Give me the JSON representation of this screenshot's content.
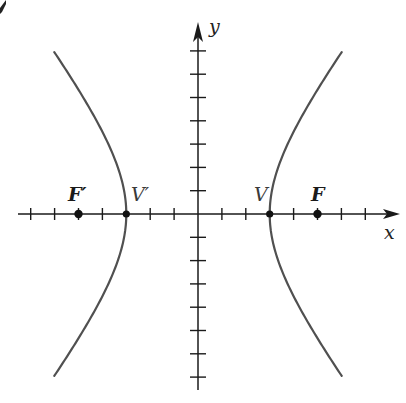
{
  "diagram": {
    "type": "hyperbola",
    "equation": "x^2/9 - y^2/16 = 1",
    "a": 3,
    "b": 4,
    "c": 5,
    "origin_px": [
      198,
      214
    ],
    "unit_px": [
      23.9,
      23.3
    ],
    "x_ticks": [
      -7,
      -6,
      -5,
      -4,
      -3,
      -2,
      -1,
      1,
      2,
      3,
      4,
      5,
      6,
      7
    ],
    "y_ticks": [
      -7,
      -6,
      -5,
      -4,
      -3,
      -2,
      -1,
      1,
      2,
      3,
      4,
      5,
      6,
      7
    ],
    "x_axis_px": {
      "start": 18,
      "end": 400
    },
    "y_axis_px": {
      "start": 22,
      "end": 390
    },
    "curve_y_range": [
      -6.95,
      6.95
    ],
    "colors": {
      "axis": "#1a1a1a",
      "curve": "#505050",
      "points": "#111111"
    }
  },
  "axes": {
    "x_label": "x",
    "y_label": "y"
  },
  "points": [
    {
      "id": "focus-left",
      "label": "F′",
      "x": -5,
      "y": 0,
      "kind": "focus"
    },
    {
      "id": "vertex-left",
      "label": "V′",
      "x": -3,
      "y": 0,
      "kind": "vertex"
    },
    {
      "id": "vertex-right",
      "label": "V",
      "x": 3,
      "y": 0,
      "kind": "vertex"
    },
    {
      "id": "focus-right",
      "label": "F",
      "x": 5,
      "y": 0,
      "kind": "focus"
    }
  ],
  "labels": {
    "focus_left": "F′",
    "vertex_left": "V′",
    "vertex_right": "V",
    "focus_right": "F"
  }
}
